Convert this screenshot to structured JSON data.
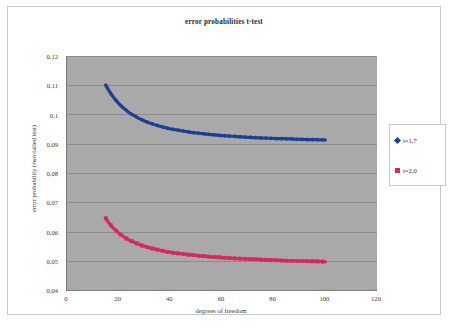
{
  "chart_data": {
    "type": "scatter",
    "title": "error probabilities t-test",
    "xlabel": "degrees of freedom",
    "ylabel": "error probability (two-tailed test)",
    "xlim": [
      0,
      120
    ],
    "ylim": [
      0.04,
      0.12
    ],
    "xticks": [
      "0",
      "20",
      "40",
      "60",
      "80",
      "100",
      "120"
    ],
    "xtick_values": [
      0,
      20,
      40,
      60,
      80,
      100,
      120
    ],
    "yticks": [
      "0,04",
      "0,05",
      "0,06",
      "0,07",
      "0,08",
      "0,09",
      "0,1",
      "0,11",
      "0,12"
    ],
    "ytick_values": [
      0.04,
      0.05,
      0.06,
      0.07,
      0.08,
      0.09,
      0.1,
      0.11,
      0.12
    ],
    "grid": "horizontal",
    "plot_background": "#a9a9a9",
    "legend_position": "right",
    "series": [
      {
        "name": "t=1,7",
        "color": "#1f3f94",
        "marker": "diamond",
        "x": [
          15,
          16,
          17,
          18,
          19,
          20,
          21,
          22,
          23,
          24,
          25,
          26,
          27,
          28,
          29,
          30,
          32,
          34,
          36,
          38,
          40,
          42,
          44,
          46,
          48,
          50,
          55,
          60,
          65,
          70,
          75,
          80,
          85,
          90,
          95,
          100
        ],
        "y": [
          0.11,
          0.1085,
          0.1071,
          0.1059,
          0.1048,
          0.1038,
          0.1029,
          0.1021,
          0.1014,
          0.1007,
          0.1001,
          0.0996,
          0.0991,
          0.0986,
          0.0982,
          0.0978,
          0.0971,
          0.0965,
          0.096,
          0.0955,
          0.0951,
          0.0948,
          0.0945,
          0.0942,
          0.0939,
          0.0937,
          0.0932,
          0.0928,
          0.0925,
          0.0922,
          0.092,
          0.0918,
          0.0917,
          0.0915,
          0.0914,
          0.0913
        ]
      },
      {
        "name": "t=2,0",
        "color": "#d62a5c",
        "marker": "square",
        "x": [
          15,
          16,
          17,
          18,
          19,
          20,
          21,
          22,
          23,
          24,
          25,
          26,
          27,
          28,
          29,
          30,
          32,
          34,
          36,
          38,
          40,
          42,
          44,
          46,
          48,
          50,
          55,
          60,
          65,
          70,
          75,
          80,
          85,
          90,
          95,
          100
        ],
        "y": [
          0.0645,
          0.0632,
          0.0621,
          0.0611,
          0.0603,
          0.0595,
          0.0588,
          0.0582,
          0.0576,
          0.0571,
          0.0567,
          0.0563,
          0.0559,
          0.0556,
          0.0552,
          0.055,
          0.0544,
          0.054,
          0.0536,
          0.0532,
          0.0529,
          0.0526,
          0.0524,
          0.0522,
          0.052,
          0.0518,
          0.0514,
          0.0511,
          0.0508,
          0.0506,
          0.0504,
          0.0502,
          0.05,
          0.0499,
          0.0498,
          0.0497
        ]
      }
    ]
  },
  "chart": {
    "title": "error probabilities t-test",
    "xaxis_title": "degrees of freedom",
    "yaxis_title": "error probability (two-tailed test)"
  },
  "legend": {
    "items": [
      {
        "label": "t=1,7",
        "color": "#1f3f94",
        "marker": "diamond"
      },
      {
        "label": "t=2,0",
        "color": "#d62a5c",
        "marker": "square"
      }
    ]
  }
}
